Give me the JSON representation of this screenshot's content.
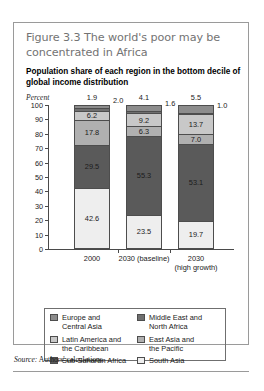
{
  "figure": {
    "title": "Figure 3.3  The world's poor may be concentrated in Africa",
    "subtitle": "Population share of each region in the bottom decile of global income distribution",
    "source_word": "Source:",
    "source_text": " Authors' calculations."
  },
  "axis": {
    "unit_label": "Percent",
    "ticks": [
      "100",
      "90",
      "80",
      "70",
      "60",
      "50",
      "40",
      "30",
      "20",
      "10",
      "0"
    ]
  },
  "legend": {
    "left": [
      {
        "label": "Europe and\nCentral Asia",
        "color": "#8c8c8c"
      },
      {
        "label": "Latin America and\nthe Caribbean",
        "color": "#c8c8c8"
      },
      {
        "label": "Sub-Saharan Africa",
        "color": "#5a5a5a"
      }
    ],
    "right": [
      {
        "label": "Middle East and\nNorth Africa",
        "color": "#6f6f6f"
      },
      {
        "label": "East Asia and\nthe Pacific",
        "color": "#b0b0b0"
      },
      {
        "label": "South Asia",
        "color": "#eeeeee"
      }
    ]
  },
  "chart_data": {
    "type": "bar",
    "title": "Population share of each region in the bottom decile of global income distribution",
    "xlabel": "",
    "ylabel": "Percent",
    "ylim": [
      0,
      100
    ],
    "grid": false,
    "stacked": true,
    "legend_position": "bottom",
    "categories": [
      "2000",
      "2030 (baseline)",
      "2030\n(high growth)"
    ],
    "series": [
      {
        "name": "South Asia",
        "color": "#eeeeee",
        "values": [
          42.6,
          23.5,
          19.7
        ]
      },
      {
        "name": "Sub-Saharan Africa",
        "color": "#5a5a5a",
        "values": [
          29.5,
          55.3,
          53.1
        ]
      },
      {
        "name": "East Asia and the Pacific",
        "color": "#b0b0b0",
        "values": [
          17.8,
          6.3,
          7.0
        ]
      },
      {
        "name": "Latin America and the Caribbean",
        "color": "#c8c8c8",
        "values": [
          6.2,
          9.2,
          13.7
        ]
      },
      {
        "name": "Middle East and North Africa",
        "color": "#6f6f6f",
        "values": [
          2.0,
          1.6,
          1.0
        ]
      },
      {
        "name": "Europe and Central Asia",
        "color": "#8c8c8c",
        "values": [
          1.9,
          4.1,
          5.5
        ]
      }
    ],
    "bars": [
      {
        "category": "2000",
        "top_label": "1.9",
        "callout_label": "2.0",
        "segments": [
          {
            "region": "South Asia",
            "value": 42.6,
            "label": "42.6",
            "color": "#eeeeee",
            "show_label": true
          },
          {
            "region": "Sub-Saharan Africa",
            "value": 29.5,
            "label": "29.5",
            "color": "#5a5a5a",
            "show_label": true
          },
          {
            "region": "East Asia and the Pacific",
            "value": 17.8,
            "label": "17.8",
            "color": "#b0b0b0",
            "show_label": true
          },
          {
            "region": "Latin America and the Caribbean",
            "value": 6.2,
            "label": "6.2",
            "color": "#c8c8c8",
            "show_label": true
          },
          {
            "region": "Middle East and North Africa",
            "value": 2.0,
            "label": "2.0",
            "color": "#6f6f6f",
            "show_label": false
          },
          {
            "region": "Europe and Central Asia",
            "value": 1.9,
            "label": "1.9",
            "color": "#8c8c8c",
            "show_label": false
          }
        ]
      },
      {
        "category": "2030 (baseline)",
        "top_label": "4.1",
        "callout_label": "1.6",
        "segments": [
          {
            "region": "South Asia",
            "value": 23.5,
            "label": "23.5",
            "color": "#eeeeee",
            "show_label": true
          },
          {
            "region": "Sub-Saharan Africa",
            "value": 55.3,
            "label": "55.3",
            "color": "#5a5a5a",
            "show_label": true
          },
          {
            "region": "East Asia and the Pacific",
            "value": 6.3,
            "label": "6.3",
            "color": "#b0b0b0",
            "show_label": true
          },
          {
            "region": "Latin America and the Caribbean",
            "value": 9.2,
            "label": "9.2",
            "color": "#c8c8c8",
            "show_label": true
          },
          {
            "region": "Middle East and North Africa",
            "value": 1.6,
            "label": "1.6",
            "color": "#6f6f6f",
            "show_label": false
          },
          {
            "region": "Europe and Central Asia",
            "value": 4.1,
            "label": "4.1",
            "color": "#8c8c8c",
            "show_label": false
          }
        ]
      },
      {
        "category": "2030\n(high growth)",
        "top_label": "5.5",
        "callout_label": "1.0",
        "segments": [
          {
            "region": "South Asia",
            "value": 19.7,
            "label": "19.7",
            "color": "#eeeeee",
            "show_label": true
          },
          {
            "region": "Sub-Saharan Africa",
            "value": 53.1,
            "label": "53.1",
            "color": "#5a5a5a",
            "show_label": true
          },
          {
            "region": "East Asia and the Pacific",
            "value": 7.0,
            "label": "7.0",
            "color": "#b0b0b0",
            "show_label": true
          },
          {
            "region": "Latin America and the Caribbean",
            "value": 13.7,
            "label": "13.7",
            "color": "#c8c8c8",
            "show_label": true
          },
          {
            "region": "Middle East and North Africa",
            "value": 1.0,
            "label": "1.0",
            "color": "#6f6f6f",
            "show_label": false
          },
          {
            "region": "Europe and Central Asia",
            "value": 5.5,
            "label": "5.5",
            "color": "#8c8c8c",
            "show_label": false
          }
        ]
      }
    ]
  }
}
